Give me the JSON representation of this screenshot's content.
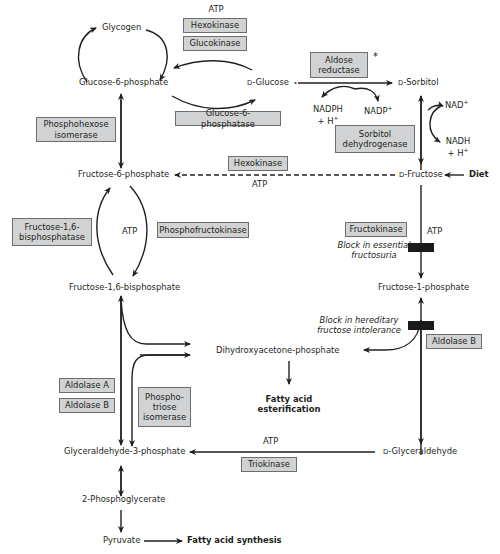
{
  "diagram": {
    "metabolites": {
      "glycogen": "Glycogen",
      "g6p": "Glucose-6-phosphate",
      "d_glucose_prefix": "D",
      "d_glucose": "-Glucose",
      "d_sorbitol_prefix": "D",
      "d_sorbitol": "-Sorbitol",
      "f6p": "Fructose-6-phosphate",
      "d_fructose_prefix": "D",
      "d_fructose": "-Fructose",
      "diet": "Diet",
      "f16bp": "Fructose-1,6-bisphosphate",
      "f1p": "Fructose-1-phosphate",
      "dhap": "Dihydroxyacetone-phosphate",
      "fa_esterification_1": "Fatty acid",
      "fa_esterification_2": "esterification",
      "g3p": "Glyceraldehyde-3-phosphate",
      "d_glyceraldehyde_prefix": "D",
      "d_glyceraldehyde": "-Glyceraldehyde",
      "pg2": "2-Phosphoglycerate",
      "pyruvate": "Pyruvate",
      "fa_synthesis": "Fatty acid synthesis"
    },
    "cofactors": {
      "atp_top": "ATP",
      "nadph_1": "NADPH",
      "nadph_2": "+ H",
      "nadph_sup": "+",
      "nadp": "NADP",
      "nadp_sup": "+",
      "nad": "NAD",
      "nad_sup": "+",
      "nadh_1": "NADH",
      "nadh_2": "+ H",
      "nadh_sup": "+",
      "atp_hexokinase": "ATP",
      "atp_pfk": "ATP",
      "atp_fructokinase": "ATP",
      "atp_triokinase": "ATP"
    },
    "enzymes": {
      "hexokinase_top": "Hexokinase",
      "glucokinase": "Glucokinase",
      "aldose_reductase_1": "Aldose",
      "aldose_reductase_2": "reductase",
      "aldose_asterisk": "*",
      "phosphohexose_isomerase_1": "Phosphohexose",
      "phosphohexose_isomerase_2": "isomerase",
      "g6pase": "Glucose-6-phosphatase",
      "sorbitol_dh_1": "Sorbitol",
      "sorbitol_dh_2": "dehydrogenase",
      "hexokinase_mid": "Hexokinase",
      "f16bpase_1": "Fructose-1,6-",
      "f16bpase_2": "bisphosphatase",
      "pfk": "Phosphofructokinase",
      "fructokinase": "Fructokinase",
      "aldolase_a": "Aldolase A",
      "aldolase_b_left": "Aldolase B",
      "tpi_1": "Phospho-",
      "tpi_2": "triose",
      "tpi_3": "isomerase",
      "aldolase_b_right": "Aldolase B",
      "triokinase": "Triokinase"
    },
    "annotations": {
      "block_efs_1": "Block in essential",
      "block_efs_2": "fructosuria",
      "block_hfi_1": "Block in hereditary",
      "block_hfi_2": "fructose intolerance"
    },
    "colors": {
      "enzyme_box_fill": "#d1d2d3",
      "enzyme_box_border": "#6d6e70",
      "arrow": "#231f20",
      "block_bar": "#1a1a1a"
    }
  }
}
